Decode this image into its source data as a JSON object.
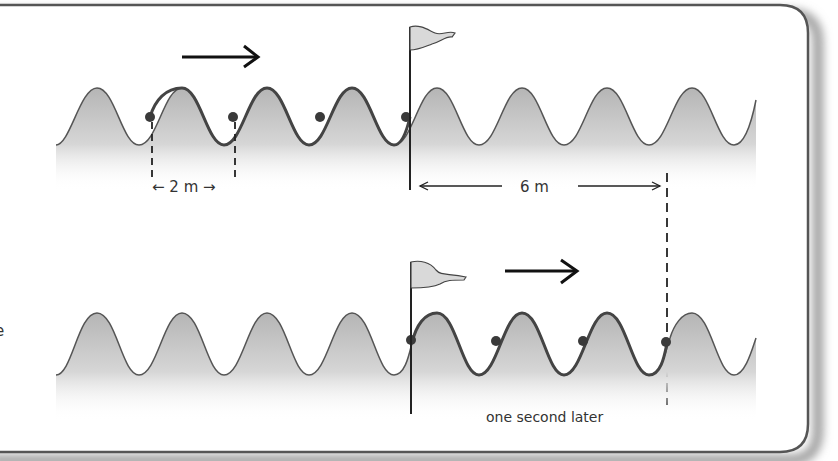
{
  "figure": {
    "labels": {
      "wavelength": "← 2 m →",
      "distance": "6 m",
      "time_note": "one second later",
      "cropped_text": "e"
    },
    "panels": [
      {
        "name": "initial",
        "flag_x": 410,
        "marked_dots": 4
      },
      {
        "name": "one-second-later",
        "flag_x": 410,
        "marked_dots": 4
      }
    ],
    "colors": {
      "frame": "#555555",
      "wave_line": "#4a4a4a",
      "wave_fill": "#bdbdbd",
      "dot": "#3a3a3a",
      "flag": "#d9d9d9",
      "arrow": "#111111"
    }
  }
}
